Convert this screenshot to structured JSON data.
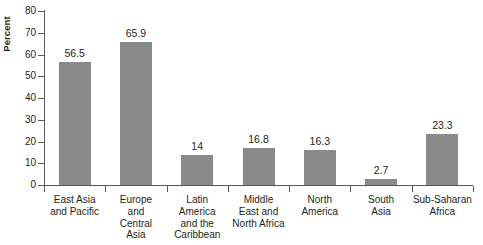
{
  "chart_data": {
    "type": "bar",
    "title": "",
    "xlabel": "",
    "ylabel": "Percent",
    "ylim": [
      0,
      80
    ],
    "yticks": [
      0,
      10,
      20,
      30,
      40,
      50,
      60,
      70,
      80
    ],
    "ytick_labels": [
      "0",
      "10",
      "20",
      "30",
      "40",
      "50",
      "60",
      "70",
      "80"
    ],
    "grid": false,
    "legend": "none",
    "bar_color": "#8a8a8a",
    "axis_color": "#58595b",
    "text_color": "#231f20",
    "categories": [
      "East Asia and Pacific",
      "Europe and Central Asia",
      "Latin America and the Caribbean",
      "Middle East and North Africa",
      "North America",
      "South Asia",
      "Sub-Saharan Africa"
    ],
    "category_label_lines": [
      [
        "East Asia",
        "and Pacific"
      ],
      [
        "Europe",
        "and",
        "Central",
        "Asia"
      ],
      [
        "Latin",
        "America",
        "and the",
        "Caribbean"
      ],
      [
        "Middle",
        "East and",
        "North Africa"
      ],
      [
        "North",
        "America"
      ],
      [
        "South",
        "Asia"
      ],
      [
        "Sub-Saharan",
        "Africa"
      ]
    ],
    "values": [
      56.5,
      65.9,
      14,
      16.8,
      16.3,
      2.7,
      23.3
    ],
    "value_labels": [
      "56.5",
      "65.9",
      "14",
      "16.8",
      "16.3",
      "2.7",
      "23.3"
    ]
  }
}
